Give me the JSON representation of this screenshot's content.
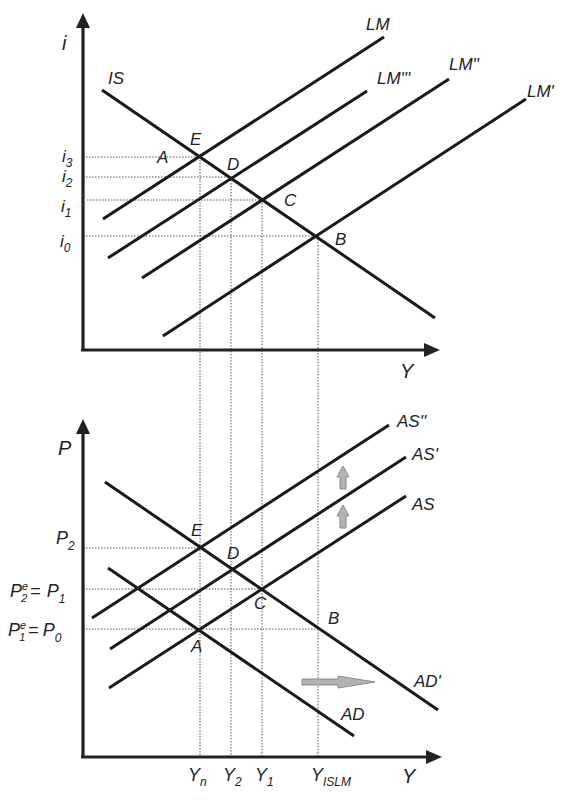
{
  "figure": {
    "top_panel": {
      "y_axis_label": "i",
      "x_axis_label": "Y",
      "curves": {
        "IS": "IS",
        "LM": "LM",
        "LM3": "LM'''",
        "LM2": "LM''",
        "LM1": "LM'"
      },
      "points": {
        "E": "E",
        "A": "A",
        "D": "D",
        "C": "C",
        "B": "B"
      },
      "tick_labels": {
        "i3": {
          "base": "i",
          "sub": "3"
        },
        "i2": {
          "base": "i",
          "sub": "2"
        },
        "i1": {
          "base": "i",
          "sub": "1"
        },
        "i0": {
          "base": "i",
          "sub": "0"
        }
      }
    },
    "bottom_panel": {
      "y_axis_label": "P",
      "x_axis_label": "Y",
      "curves": {
        "AS2": "AS''",
        "AS1": "AS'",
        "AS": "AS",
        "AD1": "AD'",
        "AD": "AD"
      },
      "points": {
        "E": "E",
        "D": "D",
        "C": "C",
        "B": "B",
        "A": "A"
      },
      "tick_labels": {
        "P2": {
          "base": "P",
          "sub": "2"
        },
        "P1_row": {
          "left_base": "P",
          "left_sup": "e",
          "left_sub": "2",
          "eq": "=",
          "right_base": "P",
          "right_sub": "1"
        },
        "P0_row": {
          "left_base": "P",
          "left_sup": "e",
          "left_sub": "1",
          "eq": "=",
          "right_base": "P",
          "right_sub": "0"
        }
      },
      "x_tick_labels": {
        "Yn": {
          "base": "Y",
          "sub": "n"
        },
        "Y2": {
          "base": "Y",
          "sub": "2"
        },
        "Y1": {
          "base": "Y",
          "sub": "1"
        },
        "YISLM": {
          "base": "Y",
          "sub": "ISLM"
        }
      },
      "arrows": {
        "shift_up_1": "up-arrow",
        "shift_up_2": "up-arrow",
        "shift_right": "right-arrow"
      }
    },
    "colors": {
      "line": "#1a1a1a",
      "guide": "#555555",
      "shift_arrow_fill": "#b3b3b3",
      "shift_arrow_stroke": "#8a8a8a"
    }
  }
}
